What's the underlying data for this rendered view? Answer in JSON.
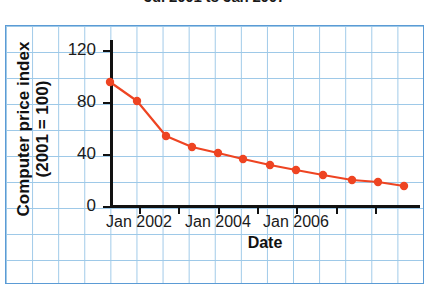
{
  "chart_data": {
    "type": "line",
    "title": "Jul 2001 to Jan 2007",
    "xlabel": "Date",
    "ylabel": "Computer price index (2001 = 100)",
    "ylabel_line1": "Computer price index",
    "ylabel_line2": "(2001 = 100)",
    "ylim": [
      0,
      130
    ],
    "yticks": [
      0,
      40,
      80,
      120
    ],
    "ytick_labels": [
      "0",
      "40",
      "80",
      "120"
    ],
    "xlim": [
      "Jul 2001",
      "Jan 2007"
    ],
    "xticks": [
      "Jan 2002",
      "Jan 2004",
      "Jan 2006"
    ],
    "xtick_labels": [
      "Jan 2002",
      "Jan 2004",
      "Jan 2006"
    ],
    "grid": "graph-paper",
    "legend": "none",
    "series_color": "#ee4422",
    "x": [
      "Jul 2001",
      "Jan 2002",
      "Jul 2002",
      "Jan 2003",
      "Jul 2003",
      "Jan 2004",
      "Jul 2004",
      "Jan 2005",
      "Jul 2005",
      "Jan 2006",
      "Jul 2006",
      "Jan 2007"
    ],
    "values": [
      95,
      81,
      54,
      45,
      41,
      36,
      32,
      28,
      24,
      20,
      18,
      15
    ],
    "points": [
      {
        "x": 110,
        "y": 82,
        "label": "Jul 2001",
        "value": 95
      },
      {
        "x": 137,
        "y": 101,
        "label": "Jan 2002",
        "value": 81
      },
      {
        "x": 166,
        "y": 136,
        "label": "Jul 2002",
        "value": 54
      },
      {
        "x": 192,
        "y": 147,
        "label": "Jan 2003",
        "value": 45
      },
      {
        "x": 218,
        "y": 153,
        "label": "Jul 2003",
        "value": 41
      },
      {
        "x": 243,
        "y": 159,
        "label": "Jan 2004",
        "value": 36
      },
      {
        "x": 270,
        "y": 165,
        "label": "Jul 2004",
        "value": 32
      },
      {
        "x": 296,
        "y": 170,
        "label": "Jan 2005",
        "value": 28
      },
      {
        "x": 323,
        "y": 175,
        "label": "Jul 2005",
        "value": 24
      },
      {
        "x": 352,
        "y": 180,
        "label": "Jan 2006",
        "value": 20
      },
      {
        "x": 378,
        "y": 182,
        "label": "Jul 2006",
        "value": 18
      },
      {
        "x": 404,
        "y": 186,
        "label": "Jan 2007",
        "value": 15
      }
    ],
    "ytick_px": [
      {
        "label": "120",
        "y": 50
      },
      {
        "label": "80",
        "y": 102
      },
      {
        "label": "40",
        "y": 154
      },
      {
        "label": "0",
        "y": 206
      }
    ],
    "xtick_px": [
      {
        "label": "Jan 2002",
        "x": 139
      },
      {
        "label": "Jan 2004",
        "x": 218
      },
      {
        "label": "Jan 2006",
        "x": 296
      }
    ],
    "minor_xtick_px": [
      110,
      139,
      178,
      218,
      257,
      296,
      336,
      375,
      414
    ]
  }
}
